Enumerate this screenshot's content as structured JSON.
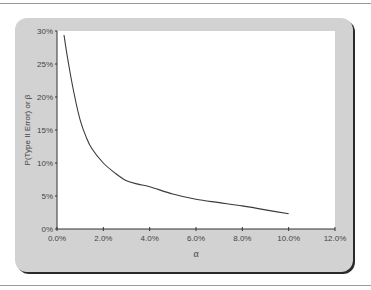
{
  "chart_data": {
    "type": "line",
    "title": "",
    "xlabel": "α",
    "ylabel": "P(Type II Error) or β",
    "xlim": [
      0,
      12
    ],
    "ylim": [
      0,
      30
    ],
    "x_ticks": [
      "0.0%",
      "2.0%",
      "4.0%",
      "6.0%",
      "8.0%",
      "10.0%",
      "12.0%"
    ],
    "y_ticks": [
      "0%",
      "5%",
      "10%",
      "15%",
      "20%",
      "25%",
      "30%"
    ],
    "grid": false,
    "legend": null,
    "series": [
      {
        "name": "beta",
        "x": [
          0.3,
          0.5,
          0.75,
          1.0,
          1.25,
          1.5,
          2.0,
          2.5,
          3.0,
          3.5,
          4.0,
          5.0,
          6.0,
          7.0,
          8.0,
          9.0,
          10.0
        ],
        "y": [
          29.4,
          25.0,
          20.3,
          16.5,
          14.0,
          12.2,
          10.0,
          8.5,
          7.3,
          6.8,
          6.4,
          5.3,
          4.5,
          4.0,
          3.5,
          2.9,
          2.3
        ]
      }
    ]
  },
  "labels": {
    "y_axis_title": "P(Type II Error) or β",
    "x_axis_title": "α"
  },
  "colors": {
    "panel": "#d2d2d2",
    "plot_bg": "#ffffff",
    "line": "#3a3a3a"
  }
}
